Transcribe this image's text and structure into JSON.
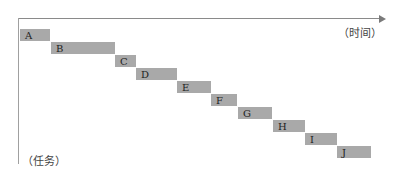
{
  "chart_data": {
    "type": "gantt",
    "title": "",
    "xlabel": "（时间）",
    "ylabel": "（任务）",
    "grid": false,
    "legend": null,
    "tasks": [
      {
        "name": "A",
        "start": 0,
        "end": 30
      },
      {
        "name": "B",
        "start": 31,
        "end": 95
      },
      {
        "name": "C",
        "start": 95,
        "end": 116
      },
      {
        "name": "D",
        "start": 116,
        "end": 157
      },
      {
        "name": "E",
        "start": 157,
        "end": 191
      },
      {
        "name": "F",
        "start": 191,
        "end": 217
      },
      {
        "name": "G",
        "start": 218,
        "end": 252
      },
      {
        "name": "H",
        "start": 253,
        "end": 285
      },
      {
        "name": "I",
        "start": 285,
        "end": 317
      },
      {
        "name": "J",
        "start": 317,
        "end": 351
      }
    ],
    "bar_color": "#a9a9a9",
    "axis_color": "#8a8a8a"
  },
  "labels": {
    "x_axis": "（时间）",
    "y_axis": "（任务）"
  }
}
